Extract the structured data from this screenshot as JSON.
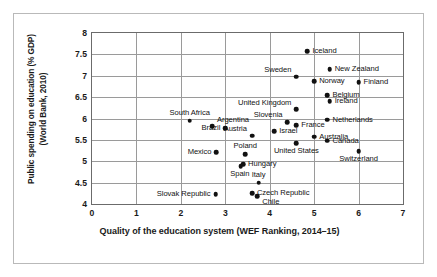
{
  "chart_data": {
    "type": "scatter",
    "title": "",
    "xlabel": "Quality of the education system (WEF Ranking, 2014–15)",
    "ylabel_line1": "Public spending on education (% GDP)",
    "ylabel_line2": "(World Bank, 2010)",
    "xlim": [
      0,
      7
    ],
    "ylim": [
      4,
      8
    ],
    "xticks": [
      "0",
      "1",
      "2",
      "3",
      "4",
      "5",
      "6",
      "7"
    ],
    "yticks": [
      "4",
      "4.5",
      "5",
      "5.5",
      "6",
      "6.5",
      "7",
      "7.5",
      "8"
    ],
    "xtick_values": [
      0,
      1,
      2,
      3,
      4,
      5,
      6,
      7
    ],
    "ytick_values": [
      4,
      4.5,
      5,
      5.5,
      6,
      6.5,
      7,
      7.5,
      8
    ],
    "grid": true,
    "legend": "none",
    "marker_color": "#111111",
    "points": [
      {
        "label": "Iceland",
        "x": 4.85,
        "y": 7.58,
        "pos": "right"
      },
      {
        "label": "New Zealand",
        "x": 5.35,
        "y": 7.15,
        "pos": "right"
      },
      {
        "label": "Sweden",
        "x": 4.6,
        "y": 6.98,
        "pos": "left-up"
      },
      {
        "label": "Norway",
        "x": 5.0,
        "y": 6.87,
        "pos": "right"
      },
      {
        "label": "Finland",
        "x": 6.0,
        "y": 6.85,
        "pos": "right"
      },
      {
        "label": "Belgium",
        "x": 5.3,
        "y": 6.55,
        "pos": "right"
      },
      {
        "label": "Ireland",
        "x": 5.35,
        "y": 6.4,
        "pos": "right"
      },
      {
        "label": "United Kingdom",
        "x": 4.6,
        "y": 6.22,
        "pos": "left-up"
      },
      {
        "label": "Netherlands",
        "x": 5.3,
        "y": 5.97,
        "pos": "right"
      },
      {
        "label": "South Africa",
        "x": 2.2,
        "y": 5.95,
        "pos": "above"
      },
      {
        "label": "Slovenia",
        "x": 4.4,
        "y": 5.92,
        "pos": "left-up"
      },
      {
        "label": "France",
        "x": 4.6,
        "y": 5.84,
        "pos": "right"
      },
      {
        "label": "Argentina",
        "x": 2.7,
        "y": 5.82,
        "pos": "right-up"
      },
      {
        "label": "Brazil",
        "x": 3.0,
        "y": 5.77,
        "pos": "left"
      },
      {
        "label": "Israel",
        "x": 4.1,
        "y": 5.7,
        "pos": "right"
      },
      {
        "label": "Austria",
        "x": 3.6,
        "y": 5.6,
        "pos": "left-up"
      },
      {
        "label": "Australia",
        "x": 5.0,
        "y": 5.57,
        "pos": "right"
      },
      {
        "label": "Canada",
        "x": 5.3,
        "y": 5.48,
        "pos": "right"
      },
      {
        "label": "United States",
        "x": 4.6,
        "y": 5.42,
        "pos": "below"
      },
      {
        "label": "Switzerland",
        "x": 6.0,
        "y": 5.23,
        "pos": "below"
      },
      {
        "label": "Mexico",
        "x": 2.8,
        "y": 5.21,
        "pos": "left"
      },
      {
        "label": "Poland",
        "x": 3.45,
        "y": 5.17,
        "pos": "above"
      },
      {
        "label": "Hungary",
        "x": 3.4,
        "y": 4.93,
        "pos": "right"
      },
      {
        "label": "Spain",
        "x": 3.35,
        "y": 4.88,
        "pos": "below-left"
      },
      {
        "label": "Italy",
        "x": 3.75,
        "y": 4.5,
        "pos": "above"
      },
      {
        "label": "Czech Republic",
        "x": 3.6,
        "y": 4.25,
        "pos": "right"
      },
      {
        "label": "Chile",
        "x": 3.72,
        "y": 4.18,
        "pos": "right-down"
      },
      {
        "label": "Slovak Republic",
        "x": 2.78,
        "y": 4.23,
        "pos": "left"
      }
    ]
  }
}
